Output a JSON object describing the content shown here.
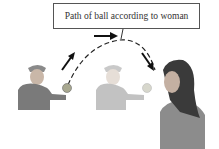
{
  "diagram": {
    "label": "Path of ball according to woman",
    "figures": [
      {
        "name": "boy-throwing",
        "opacity": "full"
      },
      {
        "name": "boy-faded",
        "opacity": "faded"
      },
      {
        "name": "woman-observer"
      }
    ],
    "colors": {
      "arrow": "#111111",
      "path": "#222222",
      "box_border": "#555555",
      "shirt": "#7a7a7a",
      "ball": "#a8a890"
    }
  }
}
